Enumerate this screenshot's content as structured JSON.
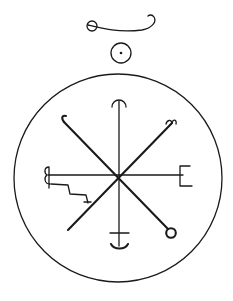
{
  "figure": {
    "title": "Seal",
    "colors": {
      "ink": "#1a1a1a",
      "background": "#ffffff"
    },
    "elements": {
      "top_glyph": "circle-with-curved-hook-tail",
      "sun_glyph": "circle-with-center-dot",
      "outer_circle": "large-enclosing-circle",
      "vertical_top_terminal": "arch-arrowhead",
      "vertical_bottom_terminal": "crossbar-with-anchor-curve",
      "horizontal_left_terminal": "curled-hook-glyph",
      "horizontal_right_terminal": "E-shaped-terminal",
      "diagonal_ul_terminal": "crook-hook",
      "diagonal_ur_terminal": "double-hook",
      "diagonal_lr_terminal": "small-circle",
      "diagonal_ll_terminal": "plain-end",
      "step_line": "zigzag-step-with-cross"
    }
  }
}
